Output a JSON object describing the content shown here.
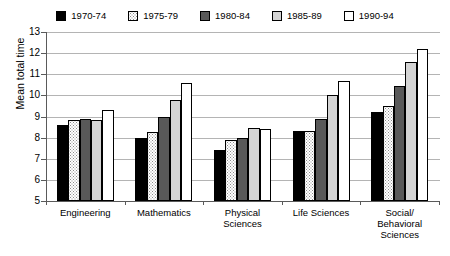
{
  "chart_data": {
    "type": "bar",
    "title": "",
    "xlabel": "",
    "ylabel": "Mean total time",
    "ylim": [
      5,
      13
    ],
    "yticks": [
      5,
      6,
      7,
      8,
      9,
      10,
      11,
      12,
      13
    ],
    "grid": true,
    "legend_position": "top",
    "categories": [
      "Engineering",
      "Mathematics",
      "Physical Sciences",
      "Life Sciences",
      "Social/ Behavioral Sciences"
    ],
    "category_lines": [
      [
        "Engineering"
      ],
      [
        "Mathematics"
      ],
      [
        "Physical",
        "Sciences"
      ],
      [
        "Life Sciences"
      ],
      [
        "Social/",
        "Behavioral",
        "Sciences"
      ]
    ],
    "series": [
      {
        "name": "1970-74",
        "fill": "black",
        "values": [
          8.6,
          8.0,
          7.4,
          8.3,
          9.2
        ]
      },
      {
        "name": "1975-79",
        "fill": "stipple",
        "values": [
          8.85,
          8.25,
          7.9,
          8.3,
          9.5
        ]
      },
      {
        "name": "1980-84",
        "fill": "darkgray",
        "values": [
          8.9,
          9.0,
          8.0,
          8.9,
          10.45
        ]
      },
      {
        "name": "1985-89",
        "fill": "lightgray",
        "values": [
          8.85,
          9.8,
          8.45,
          10.0,
          11.6
        ]
      },
      {
        "name": "1990-94",
        "fill": "white",
        "values": [
          9.3,
          10.6,
          8.4,
          10.7,
          12.2
        ]
      }
    ],
    "colors": {
      "black": "#000000",
      "stipple": "#ffffff",
      "darkgray": "#595959",
      "lightgray": "#d4d4d4",
      "white": "#ffffff",
      "axis": "#5a5a5a",
      "gridline": "#b4b4b4"
    }
  }
}
